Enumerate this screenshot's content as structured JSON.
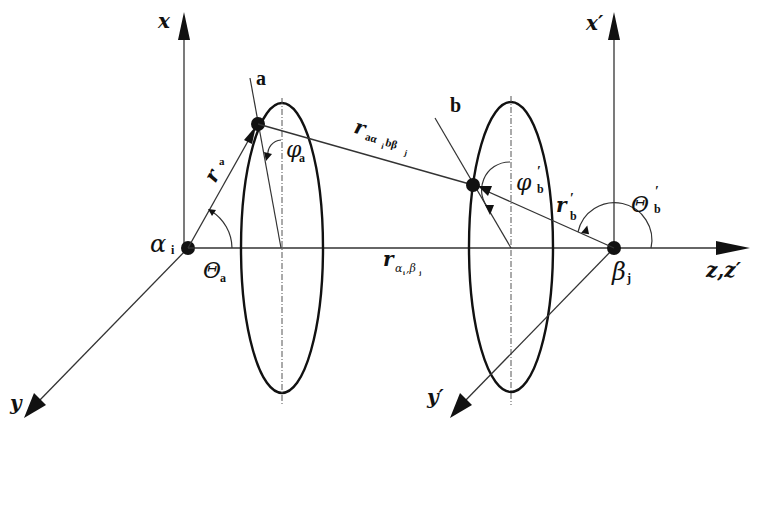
{
  "diagram": {
    "colors": {
      "stroke": "#111111",
      "background": "#ffffff"
    },
    "frames": [
      {
        "id": "alpha",
        "origin_label": "α",
        "origin_sub": "i",
        "axes": {
          "x": "x",
          "y": "y",
          "z": "z,z'"
        }
      },
      {
        "id": "beta",
        "origin_label": "β",
        "origin_sub": "j",
        "axes": {
          "x": "x'",
          "y": "y'"
        }
      }
    ],
    "points": {
      "a": {
        "label": "a"
      },
      "b": {
        "label": "b"
      }
    },
    "vectors": {
      "r_a": {
        "main": "r",
        "sub": "a"
      },
      "r_b_prime": {
        "main": "r",
        "prime": "′",
        "sub": "b"
      },
      "r_ab": {
        "main": "r",
        "sub": "aα",
        "sub2": "i",
        "sub3": " bβ",
        "sub4": "j"
      },
      "r_alpha_beta": {
        "main": "r",
        "sub": "α",
        "sub2": "i",
        "sub3": ",β",
        "sub4": "j"
      }
    },
    "angles": {
      "theta_a": {
        "symbol": "Θ",
        "sub": "a"
      },
      "phi_a": {
        "symbol": "φ",
        "sub": "a"
      },
      "phi_b_prime": {
        "symbol": "φ",
        "prime": "′",
        "sub": "b"
      },
      "theta_b_prime": {
        "symbol": "Θ",
        "prime": "′",
        "sub": "b"
      }
    },
    "axis_labels": {
      "x": "x",
      "x_prime": "x′",
      "y": "y",
      "y_prime": "y′",
      "z": "z,z′"
    }
  }
}
